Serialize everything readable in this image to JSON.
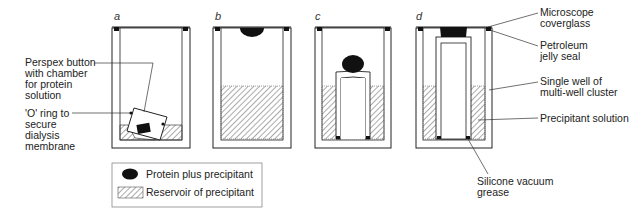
{
  "panels": [
    "a",
    "b",
    "c",
    "d"
  ],
  "labels": {
    "left": [
      {
        "lines": [
          "Perspex button",
          "with chamber",
          "for protein",
          "solution"
        ]
      },
      {
        "lines": [
          "'O' ring to",
          "secure",
          "dialysis",
          "membrane"
        ]
      }
    ],
    "right": [
      {
        "lines": [
          "Microscope",
          "coverglass"
        ]
      },
      {
        "lines": [
          "Petroleum",
          "jelly seal"
        ]
      },
      {
        "lines": [
          "Single well of",
          "multi-well cluster"
        ]
      },
      {
        "lines": [
          "Precipitant solution"
        ]
      }
    ],
    "bottom": {
      "lines": [
        "Silicone vacuum",
        "grease"
      ]
    }
  },
  "legend": {
    "items": [
      {
        "symbol": "black-ellipse",
        "label": "Protein plus precipitant"
      },
      {
        "symbol": "hatched-square",
        "label": "Reservoir of precipitant"
      }
    ]
  },
  "colors": {
    "ink": "#111111",
    "hatch": "#555555",
    "background": "#ffffff"
  }
}
